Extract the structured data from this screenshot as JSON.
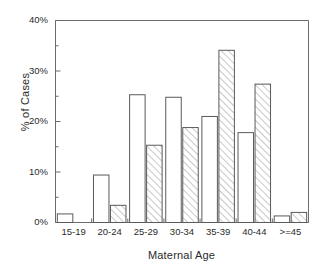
{
  "chart_data": {
    "type": "bar",
    "title": "",
    "xlabel": "Maternal Age",
    "ylabel": "% of Cases",
    "categories": [
      "15-19",
      "20-24",
      "25-29",
      "30-34",
      "35-39",
      "40-44",
      ">=45"
    ],
    "series": [
      {
        "name": "open",
        "fill": "white",
        "values": [
          1.7,
          9.4,
          25.3,
          24.8,
          21.0,
          17.8,
          1.3
        ]
      },
      {
        "name": "hatched",
        "fill": "diagonal-hatch",
        "values": [
          0,
          3.4,
          15.3,
          18.8,
          34.1,
          27.4,
          2.0
        ]
      }
    ],
    "ylim": [
      0,
      40
    ],
    "ytick_values": [
      0,
      10,
      20,
      30,
      40
    ],
    "ytick_labels": [
      "0%",
      "10%",
      "20%",
      "30%",
      "40%"
    ],
    "yminor_values": [
      5,
      15,
      25,
      35
    ],
    "grid": false,
    "legend": "none",
    "axis_color": "#6b6b6b",
    "bar_edge_color": "#5a5a5a",
    "hatch_color": "#8c8c8c"
  }
}
